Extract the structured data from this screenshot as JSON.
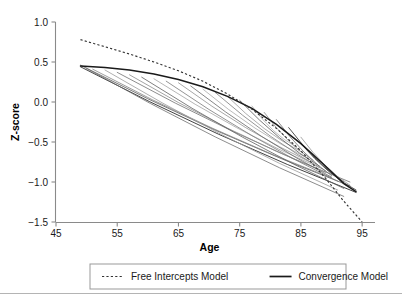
{
  "chart_data": {
    "type": "line",
    "title": "",
    "xlabel": "Age",
    "ylabel": "Z-score",
    "xlim": [
      45,
      97
    ],
    "ylim": [
      -1.5,
      1.0
    ],
    "grid": false,
    "legend_position": "bottom",
    "x_ticks": [
      45,
      55,
      65,
      75,
      85,
      95
    ],
    "x_tick_labels": [
      "45",
      "55",
      "65",
      "75",
      "85",
      "95"
    ],
    "y_ticks": [
      1.0,
      0.5,
      0.0,
      -0.5,
      -1.0,
      -1.5
    ],
    "y_tick_labels": [
      "1.0",
      "0.5",
      "0.0",
      "−0.5",
      "−1.0",
      "−1.5"
    ],
    "series": [
      {
        "name": "Free Intercepts Model",
        "style": "dashed",
        "color": "#333333",
        "x": [
          49,
          53,
          57,
          61,
          65,
          69,
          73,
          77,
          81,
          85,
          89,
          92,
          95
        ],
        "y": [
          0.78,
          0.69,
          0.6,
          0.5,
          0.39,
          0.26,
          0.1,
          -0.09,
          -0.33,
          -0.61,
          -0.95,
          -1.24,
          -1.5
        ]
      },
      {
        "name": "Convergence Model",
        "style": "solid",
        "color": "#1a1a1a",
        "x": [
          49,
          53,
          57,
          61,
          65,
          69,
          73,
          77,
          81,
          85,
          89,
          92,
          94
        ],
        "y": [
          0.45,
          0.43,
          0.4,
          0.35,
          0.28,
          0.19,
          0.07,
          -0.08,
          -0.28,
          -0.52,
          -0.8,
          -1.02,
          -1.12
        ]
      }
    ],
    "individual_trajectories": [
      {
        "color": "#2b2b2b",
        "width": 0.9,
        "x0": 49,
        "y0": 0.44,
        "x1": 94,
        "y1": -1.13
      },
      {
        "color": "#555555",
        "width": 0.8,
        "x0": 49,
        "y0": 0.46,
        "x1": 93,
        "y1": -1.05
      },
      {
        "color": "#6e6e6e",
        "width": 0.8,
        "x0": 50,
        "y0": 0.42,
        "x1": 92,
        "y1": -1.18
      },
      {
        "color": "#848484",
        "width": 0.8,
        "x0": 51,
        "y0": 0.41,
        "x1": 90,
        "y1": -0.95
      },
      {
        "color": "#9a9a9a",
        "width": 0.8,
        "x0": 53,
        "y0": 0.4,
        "x1": 91,
        "y1": -1.1
      },
      {
        "color": "#707070",
        "width": 0.8,
        "x0": 55,
        "y0": 0.37,
        "x1": 93,
        "y1": -1.0
      },
      {
        "color": "#8c8c8c",
        "width": 0.8,
        "x0": 57,
        "y0": 0.34,
        "x1": 89,
        "y1": -0.88
      },
      {
        "color": "#606060",
        "width": 0.8,
        "x0": 59,
        "y0": 0.31,
        "x1": 92,
        "y1": -1.08
      },
      {
        "color": "#a2a2a2",
        "width": 0.8,
        "x0": 61,
        "y0": 0.29,
        "x1": 88,
        "y1": -0.82
      },
      {
        "color": "#787878",
        "width": 0.8,
        "x0": 63,
        "y0": 0.26,
        "x1": 91,
        "y1": -0.99
      },
      {
        "color": "#909090",
        "width": 0.8,
        "x0": 65,
        "y0": 0.24,
        "x1": 87,
        "y1": -0.77
      },
      {
        "color": "#686868",
        "width": 0.8,
        "x0": 67,
        "y0": 0.2,
        "x1": 90,
        "y1": -0.94
      },
      {
        "color": "#aaaaaa",
        "width": 0.8,
        "x0": 69,
        "y0": 0.16,
        "x1": 86,
        "y1": -0.7
      },
      {
        "color": "#7c7c7c",
        "width": 0.8,
        "x0": 71,
        "y0": 0.12,
        "x1": 89,
        "y1": -0.86
      },
      {
        "color": "#999999",
        "width": 0.8,
        "x0": 73,
        "y0": 0.07,
        "x1": 85,
        "y1": -0.62
      },
      {
        "color": "#5a5a5a",
        "width": 0.8,
        "x0": 75,
        "y0": 0.02,
        "x1": 88,
        "y1": -0.8
      },
      {
        "color": "#b0b0b0",
        "width": 0.8,
        "x0": 77,
        "y0": -0.05,
        "x1": 84,
        "y1": -0.55
      },
      {
        "color": "#8a8a8a",
        "width": 0.8,
        "x0": 79,
        "y0": -0.13,
        "x1": 87,
        "y1": -0.73
      },
      {
        "color": "#6c6c6c",
        "width": 0.8,
        "x0": 81,
        "y0": -0.22,
        "x1": 90,
        "y1": -0.92
      },
      {
        "color": "#404040",
        "width": 0.9,
        "x0": 83,
        "y0": -0.32,
        "x1": 92,
        "y1": -1.0
      },
      {
        "color": "#959595",
        "width": 0.8,
        "x0": 85,
        "y0": -0.44,
        "x1": 93,
        "y1": -1.04
      },
      {
        "color": "#4a4a4a",
        "width": 0.9,
        "x0": 85,
        "y0": -0.52,
        "x1": 94,
        "y1": -1.1
      }
    ]
  },
  "legend": {
    "entries": [
      {
        "label": "Free Intercepts Model",
        "style": "dashed"
      },
      {
        "label": "Convergence Model",
        "style": "solid"
      }
    ]
  }
}
